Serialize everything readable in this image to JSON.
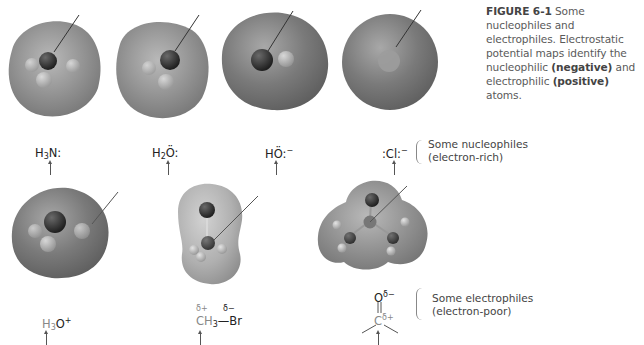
{
  "caption": {
    "figure_label": "FIGURE 6-1",
    "text_1": " Some nucleophiles and electrophiles. Electrostatic potential maps identify the nucleophilic ",
    "negative": "(negative)",
    "text_2": " and electrophilic ",
    "positive": "(positive)",
    "text_3": " atoms."
  },
  "nucleophiles": {
    "group_label_line1": "Some nucleophiles",
    "group_label_line2": "(electron-rich)",
    "items": [
      {
        "name": "ammonia",
        "formula_main": "H",
        "sub": "3",
        "rest": "N",
        "lone_pairs": ":"
      },
      {
        "name": "water",
        "formula_main": "H",
        "sub": "2",
        "rest": "Ö",
        "lone_pairs": ":"
      },
      {
        "name": "hydroxide",
        "formula_main": "HÖ",
        "charge": "−",
        "lone_pairs": ":"
      },
      {
        "name": "chloride",
        "formula_main": ":Cl",
        "charge": "−",
        "lone_pairs": ":"
      }
    ]
  },
  "electrophiles": {
    "group_label_line1": "Some electrophiles",
    "group_label_line2": "(electron-poor)",
    "items": [
      {
        "name": "hydronium",
        "formula_main": "H",
        "sub": "3",
        "rest": "O",
        "charge": "+"
      },
      {
        "name": "bromomethane",
        "left_delta": "δ+",
        "left": "CH",
        "sub": "3",
        "bond": "—",
        "right": "Br",
        "right_delta": "δ−"
      },
      {
        "name": "carbonyl",
        "top": "O",
        "top_delta": "δ−",
        "double_bond": "‖",
        "center": "C",
        "center_delta": "δ+"
      }
    ]
  },
  "colors": {
    "surface_dark": "#6a6a6a",
    "surface_mid": "#8a8a8a",
    "surface_light": "#b8b8b8",
    "atom_dark": "#2d2d2d",
    "atom_light": "#c8c8c8"
  }
}
